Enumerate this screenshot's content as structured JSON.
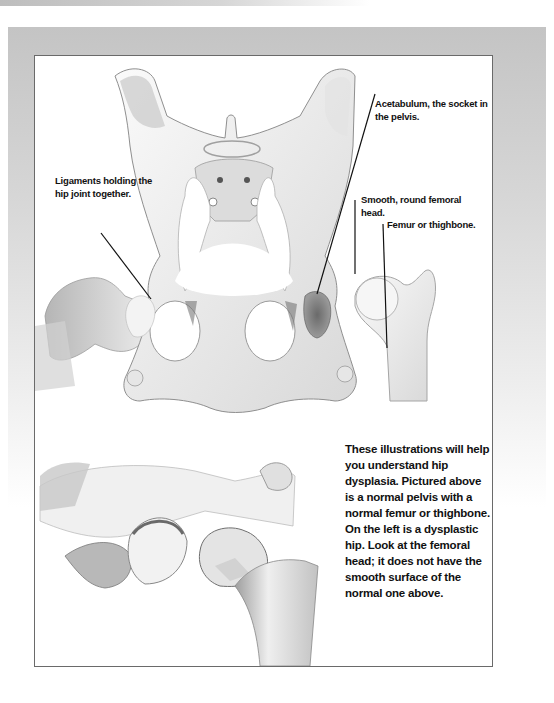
{
  "labels": {
    "ligaments": "Ligaments holding the hip joint together.",
    "acetabulum": "Acetabulum, the socket in the pelvis.",
    "femoral_head": "Smooth, round femoral head.",
    "femur": "Femur or thighbone."
  },
  "caption": "These illustrations will help you understand hip dysplasia. Pictured above is a normal pelvis with a normal femur or thighbone. On the left is a dysplastic hip. Look at the femoral head; it does not have the smooth surface of the normal one above.",
  "illustrations": {
    "top": "Normal canine pelvis with normal femur",
    "bottom": "Dysplastic hip joint"
  },
  "colors": {
    "frame_border": "#6a6a6a",
    "band": "#cfcfcf",
    "text": "#111111",
    "bone_light": "#f1f1f1",
    "bone_shade": "#a8a8a8"
  }
}
